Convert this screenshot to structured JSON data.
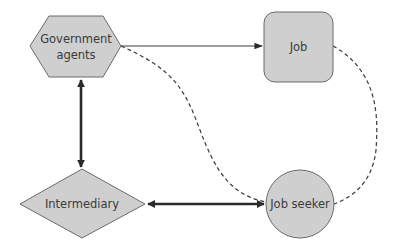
{
  "diagram": {
    "type": "flow-network",
    "nodes": [
      {
        "id": "government",
        "label_lines": [
          "Government",
          "agents"
        ],
        "shape": "hexagon"
      },
      {
        "id": "job",
        "label": "Job",
        "shape": "rounded-rectangle"
      },
      {
        "id": "intermediary",
        "label": "Intermediary",
        "shape": "diamond"
      },
      {
        "id": "jobseeker",
        "label": "Job seeker",
        "shape": "circle"
      }
    ],
    "edges": [
      {
        "from": "government",
        "to": "job",
        "style": "solid",
        "arrow": "end"
      },
      {
        "from": "government",
        "to": "intermediary",
        "style": "thick",
        "arrow": "both"
      },
      {
        "from": "intermediary",
        "to": "jobseeker",
        "style": "thick",
        "arrow": "both"
      },
      {
        "from": "government",
        "to": "jobseeker",
        "style": "dashed",
        "arrow": "none"
      },
      {
        "from": "job",
        "to": "jobseeker",
        "style": "dashed",
        "arrow": "none"
      }
    ],
    "colors": {
      "node_fill": "#cfcfcf",
      "node_stroke": "#6b6b6b",
      "edge": "#2a2a2a",
      "text": "#3a3a3a"
    }
  },
  "labels": {
    "government_line1": "Government",
    "government_line2": "agents",
    "job": "Job",
    "intermediary": "Intermediary",
    "jobseeker": "Job seeker"
  }
}
